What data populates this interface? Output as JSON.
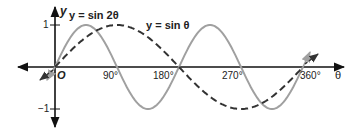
{
  "chart_data": {
    "type": "line",
    "title": "",
    "xlabel": "θ",
    "ylabel": "y",
    "origin_label": "O",
    "xlim": [
      -55,
      420
    ],
    "ylim": [
      -1.2,
      1.2
    ],
    "x_ticks": [
      {
        "value": 90,
        "label": "90°"
      },
      {
        "value": 180,
        "label": "180°"
      },
      {
        "value": 270,
        "label": "270°"
      },
      {
        "value": 360,
        "label": "360°"
      }
    ],
    "y_ticks": [
      {
        "value": 1,
        "label": "1"
      },
      {
        "value": -1,
        "label": "−1"
      }
    ],
    "grid": false,
    "series": [
      {
        "name": "y = sin 2θ",
        "style": "solid",
        "color": "#a0a0a0",
        "function": "sin(2θ)",
        "x": [
          0,
          45,
          90,
          135,
          180,
          225,
          270,
          315,
          360
        ],
        "values": [
          0,
          1,
          0,
          -1,
          0,
          1,
          0,
          -1,
          0
        ]
      },
      {
        "name": "y = sin θ",
        "style": "dashed",
        "color": "#333333",
        "function": "sin(θ)",
        "x": [
          0,
          90,
          180,
          270,
          360
        ],
        "values": [
          0,
          1,
          0,
          -1,
          0
        ]
      }
    ],
    "annotations": [
      {
        "text": "y = sin 2θ",
        "near": "first peak of sin 2θ"
      },
      {
        "text": "y = sin θ",
        "near": "peak of sin θ"
      }
    ]
  },
  "labels": {
    "y_axis": "y",
    "x_axis": "θ",
    "origin": "O",
    "one": "1",
    "minus_one": "−1",
    "t90": "90°",
    "t180": "180°",
    "t270": "270°",
    "t360": "360°",
    "sin2": "y = sin 2θ",
    "sin1": "y = sin θ"
  }
}
